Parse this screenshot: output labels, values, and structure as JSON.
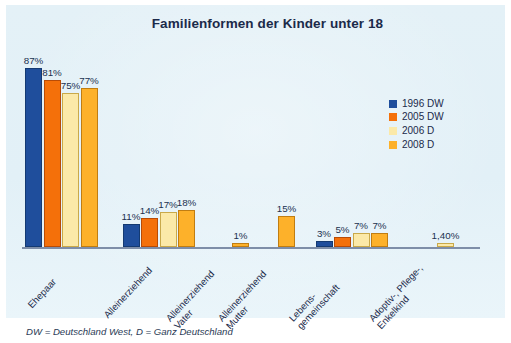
{
  "chart_data": {
    "type": "bar",
    "title": "Familienformen der Kinder unter 18",
    "xlabel": "",
    "ylabel": "",
    "ylim": [
      0,
      100
    ],
    "grid": false,
    "legend_position": "right",
    "categories": [
      "Ehepaar",
      "Alleinerziehend",
      "Alleinerziehend Vater",
      "Alleinerziehend Mutter",
      "Lebens- gemeinschaft",
      "Adoptiv-, Pflege-, Enkelkind"
    ],
    "series": [
      {
        "name": "1996 DW",
        "color": "#1F4E9C",
        "values": [
          87,
          11,
          null,
          null,
          3,
          null
        ]
      },
      {
        "name": "2005 DW",
        "color": "#F4700A",
        "values": [
          81,
          14,
          null,
          null,
          5,
          null
        ]
      },
      {
        "name": "2006 D",
        "color": "#FBE9A8",
        "values": [
          75,
          17,
          null,
          null,
          7,
          1.4
        ]
      },
      {
        "name": "2008 D",
        "color": "#FDB12A",
        "values": [
          77,
          18,
          1,
          15,
          7,
          null
        ]
      }
    ],
    "footnote": "DW = Deutschland West, D = Ganz Deutschland"
  },
  "chart": {
    "title": "Familienformen der Kinder unter 18",
    "footnote": "DW = Deutschland West, D = Ganz Deutschland"
  },
  "legend": {
    "items": [
      {
        "label": "1996 DW",
        "color": "#1F4E9C"
      },
      {
        "label": "2005 DW",
        "color": "#F4700A"
      },
      {
        "label": "2006 D",
        "color": "#FBE9A8"
      },
      {
        "label": "2008 D",
        "color": "#FDB12A"
      }
    ]
  },
  "categories": [
    {
      "label": "Ehepaar"
    },
    {
      "label": "Alleinerziehend"
    },
    {
      "label": "Alleinerziehend\nVater"
    },
    {
      "label": "Alleinerziehend\nMutter"
    },
    {
      "label": "Lebens-\ngemeinschaft"
    },
    {
      "label": "Adoptiv-, Pflege-,\nEnkelkind"
    }
  ],
  "bars": [
    {
      "value_label": "87%",
      "series": "1996 DW",
      "category": "Ehepaar"
    },
    {
      "value_label": "81%",
      "series": "2005 DW",
      "category": "Ehepaar"
    },
    {
      "value_label": "75%",
      "series": "2006 D",
      "category": "Ehepaar"
    },
    {
      "value_label": "77%",
      "series": "2008 D",
      "category": "Ehepaar"
    },
    {
      "value_label": "11%",
      "series": "1996 DW",
      "category": "Alleinerziehend"
    },
    {
      "value_label": "14%",
      "series": "2005 DW",
      "category": "Alleinerziehend"
    },
    {
      "value_label": "17%",
      "series": "2006 D",
      "category": "Alleinerziehend"
    },
    {
      "value_label": "18%",
      "series": "2008 D",
      "category": "Alleinerziehend"
    },
    {
      "value_label": "1%",
      "series": "2008 D",
      "category": "Alleinerziehend Vater"
    },
    {
      "value_label": "15%",
      "series": "2008 D",
      "category": "Alleinerziehend Mutter"
    },
    {
      "value_label": "3%",
      "series": "1996 DW",
      "category": "Lebensgemeinschaft"
    },
    {
      "value_label": "5%",
      "series": "2005 DW",
      "category": "Lebensgemeinschaft"
    },
    {
      "value_label": "7%",
      "series": "2006 D",
      "category": "Lebensgemeinschaft"
    },
    {
      "value_label": "7%",
      "series": "2008 D",
      "category": "Lebensgemeinschaft"
    },
    {
      "value_label": "1,40%",
      "series": "2006 D",
      "category": "Adoptiv-, Pflege-, Enkelkind"
    }
  ]
}
